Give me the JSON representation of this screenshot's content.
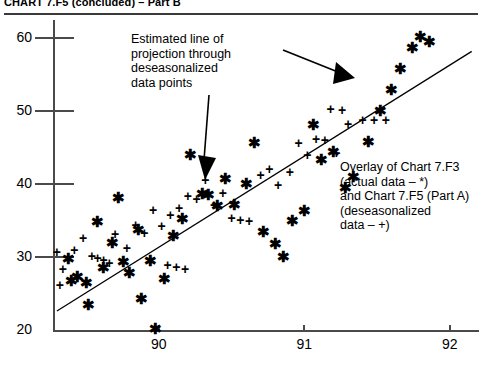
{
  "header": {
    "title": "CHART 7.F5 (concluded) – Part B"
  },
  "annotations": {
    "line_note": "Estimated line of\nprojection through\ndeseasonalized\ndata points",
    "overlay_note": "Overlay of Chart 7.F3\n(actual data – *)\nand Chart 7.F5 (Part A)\n(deseasonalized\ndata – +)"
  },
  "chart_data": {
    "type": "scatter",
    "title": "CHART 7.F5 (concluded) – Part B",
    "xlabel": "",
    "ylabel": "",
    "xlim": [
      89.28,
      92.2
    ],
    "ylim": [
      20,
      62.5
    ],
    "xticks": [
      90,
      91,
      92
    ],
    "yticks": [
      20,
      30,
      40,
      50,
      60
    ],
    "xtick_labels": [
      "90",
      "91",
      "92"
    ],
    "ytick_labels": [
      "20",
      "30",
      "40",
      "50",
      "60"
    ],
    "grid": false,
    "legend": "none",
    "legend_note": "Overlay of Chart 7.F3 (actual data – *) and Chart 7.F5 (Part A) (deseasonalized data – +)",
    "trendline": {
      "label": "Estimated line of projection through deseasonalized data points",
      "x0": 89.3,
      "y0": 22.6,
      "x1": 92.15,
      "y1": 58.2
    },
    "series": [
      {
        "name": "actual data",
        "marker": "*",
        "points": [
          [
            89.38,
            29.9
          ],
          [
            89.4,
            26.8
          ],
          [
            89.44,
            27.4
          ],
          [
            89.5,
            26.6
          ],
          [
            89.52,
            23.6
          ],
          [
            89.58,
            35.0
          ],
          [
            89.62,
            28.6
          ],
          [
            89.68,
            32.1
          ],
          [
            89.72,
            38.3
          ],
          [
            89.76,
            29.4
          ],
          [
            89.8,
            28.0
          ],
          [
            89.86,
            33.9
          ],
          [
            89.88,
            24.4
          ],
          [
            89.94,
            29.6
          ],
          [
            89.98,
            20.3
          ],
          [
            90.04,
            27.1
          ],
          [
            90.1,
            33.0
          ],
          [
            90.16,
            35.4
          ],
          [
            90.22,
            44.1
          ],
          [
            90.3,
            38.8
          ],
          [
            90.34,
            38.6
          ],
          [
            90.4,
            37.1
          ],
          [
            90.46,
            40.9
          ],
          [
            90.52,
            37.3
          ],
          [
            90.6,
            40.2
          ],
          [
            90.66,
            45.8
          ],
          [
            90.72,
            33.6
          ],
          [
            90.8,
            31.9
          ],
          [
            90.86,
            30.1
          ],
          [
            90.92,
            35.1
          ],
          [
            91.0,
            36.4
          ],
          [
            91.06,
            48.2
          ],
          [
            91.12,
            43.4
          ],
          [
            91.2,
            44.6
          ],
          [
            91.28,
            39.6
          ],
          [
            91.34,
            41.1
          ],
          [
            91.44,
            45.9
          ],
          [
            91.52,
            50.1
          ],
          [
            91.6,
            53.1
          ],
          [
            91.66,
            55.9
          ],
          [
            91.74,
            58.8
          ],
          [
            91.8,
            60.3
          ],
          [
            91.86,
            59.6
          ]
        ]
      },
      {
        "name": "deseasonalized data",
        "marker": "+",
        "points": [
          [
            89.34,
            28.3
          ],
          [
            89.42,
            31.0
          ],
          [
            89.48,
            32.6
          ],
          [
            89.54,
            30.2
          ],
          [
            89.58,
            29.9
          ],
          [
            89.62,
            29.6
          ],
          [
            89.66,
            29.2
          ],
          [
            89.7,
            33.1
          ],
          [
            89.78,
            31.3
          ],
          [
            89.84,
            34.4
          ],
          [
            89.9,
            33.3
          ],
          [
            89.96,
            36.5
          ],
          [
            90.02,
            34.2
          ],
          [
            90.08,
            35.8
          ],
          [
            90.14,
            36.7
          ],
          [
            90.2,
            38.4
          ],
          [
            90.26,
            37.9
          ],
          [
            90.32,
            40.6
          ],
          [
            90.38,
            37.2
          ],
          [
            90.44,
            38.8
          ],
          [
            90.5,
            35.3
          ],
          [
            90.56,
            35.1
          ],
          [
            90.62,
            34.9
          ],
          [
            90.7,
            41.3
          ],
          [
            90.76,
            42.1
          ],
          [
            90.82,
            39.9
          ],
          [
            90.9,
            41.6
          ],
          [
            90.96,
            45.6
          ],
          [
            91.02,
            44.0
          ],
          [
            91.08,
            46.2
          ],
          [
            91.14,
            46.1
          ],
          [
            91.22,
            44.3
          ],
          [
            91.3,
            48.2
          ],
          [
            91.4,
            48.8
          ],
          [
            91.48,
            48.8
          ],
          [
            91.56,
            48.8
          ],
          [
            89.3,
            30.7
          ],
          [
            89.32,
            26.2
          ],
          [
            90.06,
            28.9
          ],
          [
            90.12,
            28.6
          ],
          [
            90.18,
            28.4
          ],
          [
            91.18,
            50.3
          ],
          [
            91.26,
            50.2
          ]
        ]
      }
    ]
  }
}
